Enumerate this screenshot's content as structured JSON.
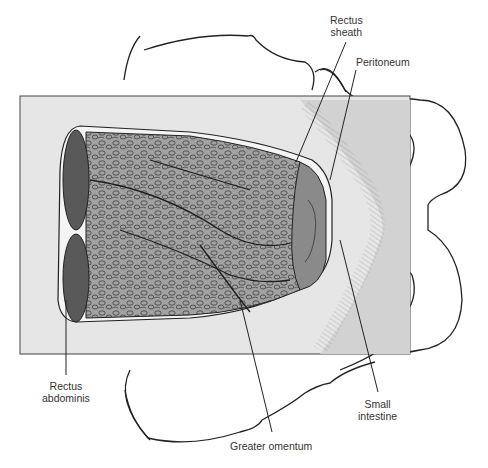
{
  "figure": {
    "colors": {
      "background": "#ffffff",
      "panel": "#e6e6e6",
      "panel_shade": "#d0d0d0",
      "omentum": "#9e9e9e",
      "omentum_texture": "#3a3a3a",
      "rectus_muscle": "#5a5a5a",
      "intestine": "#8a8a8a",
      "outline": "#222222"
    }
  },
  "labels": {
    "rectus_sheath": [
      "Rectus",
      "sheath"
    ],
    "peritoneum": [
      "Peritoneum"
    ],
    "rectus_abdominis": [
      "Rectus",
      "abdominis"
    ],
    "small_intestine": [
      "Small",
      "intestine"
    ],
    "greater_omentum": [
      "Greater omentum"
    ]
  }
}
